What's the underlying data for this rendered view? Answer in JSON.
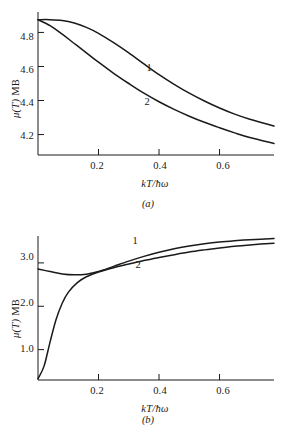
{
  "figure": {
    "background": "#ffffff",
    "ink_color": "#1a1a1a",
    "panels": [
      {
        "caption": "(a)",
        "ylabel_mu": "μ(T)",
        "ylabel_unit": " MB",
        "xlabel": "kT/ħω",
        "xticks": [
          "0.2",
          "0.4",
          "0.6"
        ],
        "yticks": [
          "4.8",
          "4.6",
          "4.4",
          "4.2"
        ],
        "curve_labels": [
          "1",
          "2"
        ]
      },
      {
        "caption": "(b)",
        "ylabel_mu": "μ(T)",
        "ylabel_unit": " MB",
        "xlabel": "kT/ħω",
        "xticks": [
          "0.2",
          "0.4",
          "0.6"
        ],
        "yticks": [
          "3.0",
          "2.0",
          "1.0"
        ],
        "curve_labels": [
          "1",
          "2"
        ]
      }
    ]
  },
  "chart_data": [
    {
      "type": "line",
      "title": "",
      "panel": "(a)",
      "xlabel": "kT/ħω",
      "ylabel": "μ(T) MB",
      "xlim": [
        0.0,
        0.78
      ],
      "ylim": [
        4.08,
        4.92
      ],
      "xticks": [
        0.2,
        0.4,
        0.6
      ],
      "yticks": [
        4.2,
        4.4,
        4.6,
        4.8
      ],
      "grid": false,
      "legend": "inline-curve-labels",
      "series": [
        {
          "name": "1",
          "label_position": {
            "x": 0.35,
            "y": 4.62
          },
          "x": [
            0.0,
            0.04,
            0.08,
            0.12,
            0.16,
            0.2,
            0.25,
            0.3,
            0.35,
            0.4,
            0.45,
            0.5,
            0.55,
            0.6,
            0.65,
            0.7,
            0.78
          ],
          "y": [
            4.875,
            4.875,
            4.87,
            4.855,
            4.83,
            4.795,
            4.74,
            4.68,
            4.615,
            4.552,
            4.495,
            4.443,
            4.397,
            4.356,
            4.32,
            4.29,
            4.25
          ]
        },
        {
          "name": "2",
          "label_position": {
            "x": 0.34,
            "y": 4.39
          },
          "x": [
            0.0,
            0.04,
            0.08,
            0.12,
            0.16,
            0.2,
            0.25,
            0.3,
            0.35,
            0.4,
            0.45,
            0.5,
            0.55,
            0.6,
            0.65,
            0.7,
            0.78
          ],
          "y": [
            4.875,
            4.84,
            4.79,
            4.735,
            4.68,
            4.625,
            4.56,
            4.5,
            4.443,
            4.393,
            4.348,
            4.308,
            4.272,
            4.24,
            4.21,
            4.183,
            4.148
          ]
        }
      ]
    },
    {
      "type": "line",
      "title": "",
      "panel": "(b)",
      "xlabel": "kT/ħω",
      "ylabel": "μ(T) MB",
      "xlim": [
        0.0,
        0.78
      ],
      "ylim": [
        0.3,
        3.62
      ],
      "xticks": [
        0.2,
        0.4,
        0.6
      ],
      "yticks": [
        1.0,
        2.0,
        3.0
      ],
      "grid": false,
      "legend": "inline-curve-labels",
      "series": [
        {
          "name": "1",
          "label_position": {
            "x": 0.3,
            "y": 3.25
          },
          "x": [
            0.0,
            0.04,
            0.08,
            0.12,
            0.16,
            0.2,
            0.25,
            0.3,
            0.35,
            0.4,
            0.45,
            0.5,
            0.55,
            0.6,
            0.65,
            0.7,
            0.78
          ],
          "y": [
            2.86,
            2.8,
            2.745,
            2.725,
            2.74,
            2.8,
            2.92,
            3.04,
            3.15,
            3.245,
            3.325,
            3.39,
            3.44,
            3.48,
            3.51,
            3.535,
            3.56
          ]
        },
        {
          "name": "2",
          "label_position": {
            "x": 0.31,
            "y": 2.78
          },
          "x": [
            0.0,
            0.02,
            0.04,
            0.06,
            0.08,
            0.1,
            0.13,
            0.16,
            0.2,
            0.25,
            0.3,
            0.35,
            0.4,
            0.45,
            0.5,
            0.55,
            0.6,
            0.65,
            0.7,
            0.78
          ],
          "y": [
            0.33,
            0.62,
            1.18,
            1.7,
            2.07,
            2.32,
            2.545,
            2.68,
            2.79,
            2.89,
            2.975,
            3.055,
            3.125,
            3.19,
            3.25,
            3.3,
            3.345,
            3.385,
            3.415,
            3.455
          ]
        }
      ]
    }
  ]
}
